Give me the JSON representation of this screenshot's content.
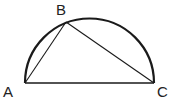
{
  "diagram": {
    "type": "semicircle-inscribed-triangle",
    "points": {
      "A": {
        "label": "A",
        "x": 25,
        "y": 83
      },
      "B": {
        "label": "B",
        "x": 66,
        "y": 22
      },
      "C": {
        "label": "C",
        "x": 154,
        "y": 83
      }
    },
    "segments": [
      "AB",
      "BC",
      "AC"
    ],
    "arc": {
      "from": "A",
      "to": "C",
      "shape": "semicircle"
    },
    "colors": {
      "stroke": "#1a1a1a",
      "background": "#ffffff"
    }
  }
}
